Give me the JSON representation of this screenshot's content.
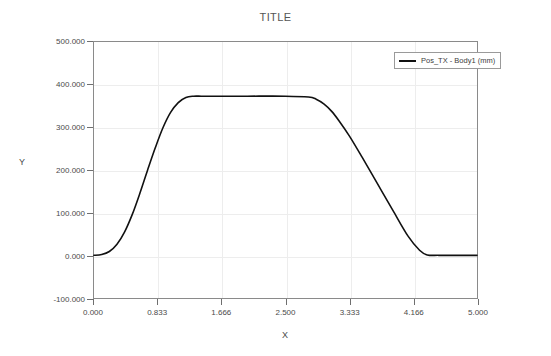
{
  "chart_data": {
    "type": "line",
    "title": "TITLE",
    "xlabel": "X",
    "ylabel": "Y",
    "xlim": [
      0.0,
      5.0
    ],
    "ylim": [
      -100.0,
      500.0
    ],
    "grid": true,
    "legend_position": "top-right",
    "xticks": [
      0.0,
      0.833,
      1.666,
      2.5,
      3.333,
      4.166,
      5.0
    ],
    "xtick_labels": [
      "0.000",
      "0.833",
      "1.666",
      "2.500",
      "3.333",
      "4.166",
      "5.000"
    ],
    "yticks": [
      -100.0,
      0.0,
      100.0,
      200.0,
      300.0,
      400.0,
      500.0
    ],
    "ytick_labels": [
      "-100.000",
      "0.000",
      "100.000",
      "200.000",
      "300.000",
      "400.000",
      "500.000"
    ],
    "series": [
      {
        "name": "Pos_TX - Body1 (mm)",
        "color": "#111111",
        "x": [
          0.0,
          0.1,
          0.2,
          0.3,
          0.4,
          0.5,
          0.6,
          0.7,
          0.8,
          0.9,
          1.0,
          1.1,
          1.2,
          1.3,
          1.4,
          1.5,
          1.666,
          2.0,
          2.5,
          2.8,
          2.9,
          3.0,
          3.1,
          3.2,
          3.333,
          3.5,
          3.7,
          3.9,
          4.1,
          4.25,
          4.35,
          4.5,
          4.75,
          5.0
        ],
        "y": [
          0.0,
          2.0,
          9.0,
          26.0,
          55.0,
          96.0,
          146.0,
          200.0,
          252.0,
          299.0,
          335.0,
          358.0,
          370.0,
          373.0,
          373.0,
          373.0,
          373.0,
          373.0,
          373.0,
          371.0,
          366.0,
          355.0,
          338.0,
          315.0,
          280.0,
          230.0,
          168.0,
          106.0,
          45.0,
          12.0,
          1.0,
          0.0,
          0.0,
          0.0
        ]
      }
    ]
  },
  "legend": {
    "entries": [
      {
        "label": "Pos_TX - Body1 (mm)",
        "color": "#111111"
      }
    ]
  }
}
